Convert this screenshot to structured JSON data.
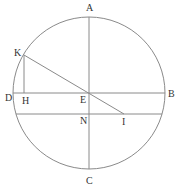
{
  "diagram": {
    "type": "geometry",
    "stroke_color": "#8a8a8a",
    "label_color": "#333333",
    "circle": {
      "center": "E",
      "cx": 89,
      "cy": 93,
      "r": 76
    },
    "points": {
      "A": {
        "label": "A",
        "x": 89,
        "y": 17
      },
      "B": {
        "label": "B",
        "x": 165,
        "y": 93
      },
      "C": {
        "label": "C",
        "x": 89,
        "y": 169
      },
      "D": {
        "label": "D",
        "x": 13,
        "y": 93
      },
      "E": {
        "label": "E",
        "x": 89,
        "y": 93
      },
      "H": {
        "label": "H",
        "x": 24,
        "y": 93
      },
      "K": {
        "label": "K",
        "x": 24,
        "y": 55
      },
      "N": {
        "label": "N",
        "x": 89,
        "y": 114
      },
      "I": {
        "label": "I",
        "x": 124,
        "y": 114
      }
    },
    "segments": [
      {
        "name": "diameter-AC",
        "from": "A",
        "to": "C"
      },
      {
        "name": "diameter-DB",
        "from": "D",
        "to": "B"
      },
      {
        "name": "segment-KH",
        "from": "K",
        "to": "H"
      },
      {
        "name": "segment-KI",
        "from": "K",
        "to": "I"
      },
      {
        "name": "chord-through-N",
        "from": "N",
        "to": "I"
      }
    ]
  }
}
